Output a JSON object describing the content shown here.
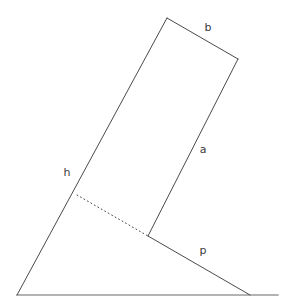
{
  "figure": {
    "kind": "geometry-diagram",
    "canvas": {
      "width": 286,
      "height": 304,
      "background": "#ffffff"
    },
    "colors": {
      "stroke": "#4a4a4a",
      "ground_stroke": "#9a9a9a",
      "dotted_stroke": "#4a4a4a",
      "label_text": "#3a3a3a"
    },
    "labels": [
      {
        "id": "b",
        "text": "b",
        "x": 208,
        "y": 28
      },
      {
        "id": "a",
        "text": "a",
        "x": 203,
        "y": 150
      },
      {
        "id": "h",
        "text": "h",
        "x": 67,
        "y": 173
      },
      {
        "id": "p",
        "text": "p",
        "x": 203,
        "y": 251
      }
    ],
    "points": {
      "rect_top_left": {
        "x": 167,
        "y": 18
      },
      "rect_top_right": {
        "x": 238,
        "y": 59
      },
      "rect_bottom_right": {
        "x": 148,
        "y": 236
      },
      "rect_bottom_left": {
        "x": 77,
        "y": 195
      },
      "hypotenuse_foot": {
        "x": 17,
        "y": 295
      },
      "p_foot": {
        "x": 250,
        "y": 295
      },
      "ground_left": {
        "x": 17,
        "y": 295
      },
      "ground_right": {
        "x": 278,
        "y": 295
      }
    },
    "segments": [
      {
        "id": "hypotenuse-h",
        "name": "h",
        "style": "solid",
        "x1": 167,
        "y1": 18,
        "x2": 17,
        "y2": 295
      },
      {
        "id": "side-b",
        "name": "b",
        "style": "solid",
        "x1": 167,
        "y1": 18,
        "x2": 238,
        "y2": 59
      },
      {
        "id": "side-a",
        "name": "a",
        "style": "solid",
        "x1": 238,
        "y1": 59,
        "x2": 148,
        "y2": 236
      },
      {
        "id": "dotted-base",
        "name": "",
        "style": "dotted",
        "x1": 77,
        "y1": 195,
        "x2": 148,
        "y2": 236
      },
      {
        "id": "side-p",
        "name": "p",
        "style": "solid",
        "x1": 148,
        "y1": 236,
        "x2": 250,
        "y2": 295
      },
      {
        "id": "ground-line",
        "name": "",
        "style": "solid",
        "x1": 17,
        "y1": 295,
        "x2": 278,
        "y2": 295
      }
    ]
  },
  "chart_data": {
    "type": "diagram",
    "title": "",
    "xlabel": "",
    "ylabel": "",
    "annotations": [
      "b",
      "a",
      "h",
      "p"
    ]
  }
}
